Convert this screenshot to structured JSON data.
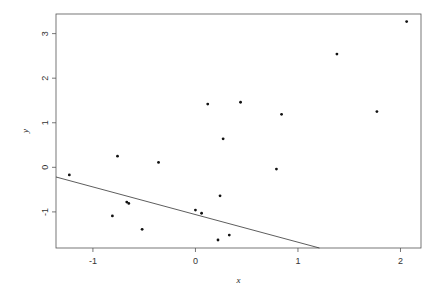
{
  "chart_data": {
    "type": "scatter",
    "title": "",
    "xlabel": "x",
    "ylabel": "y",
    "xlim": [
      -1.36,
      2.2
    ],
    "ylim": [
      -1.81,
      3.44
    ],
    "grid": false,
    "legend": "none",
    "x_ticks": [
      -1,
      0,
      1,
      2
    ],
    "x_tick_labels": [
      "-1",
      "0",
      "1",
      "2"
    ],
    "y_ticks": [
      -1,
      0,
      1,
      2,
      3
    ],
    "y_tick_labels": [
      "-1",
      "0",
      "1",
      "2",
      "3"
    ],
    "points": [
      {
        "x": -1.23,
        "y": -0.17
      },
      {
        "x": -0.76,
        "y": 0.25
      },
      {
        "x": -0.36,
        "y": 0.11
      },
      {
        "x": -0.67,
        "y": -0.78
      },
      {
        "x": -0.65,
        "y": -0.81
      },
      {
        "x": -0.81,
        "y": -1.09
      },
      {
        "x": -0.52,
        "y": -1.39
      },
      {
        "x": 0.0,
        "y": -0.96
      },
      {
        "x": 0.06,
        "y": -1.03
      },
      {
        "x": 0.22,
        "y": -1.63
      },
      {
        "x": 0.33,
        "y": -1.52
      },
      {
        "x": 0.24,
        "y": -0.64
      },
      {
        "x": 0.27,
        "y": 0.64
      },
      {
        "x": 0.12,
        "y": 1.42
      },
      {
        "x": 0.44,
        "y": 1.46
      },
      {
        "x": 0.79,
        "y": -0.04
      },
      {
        "x": 0.84,
        "y": 1.19
      },
      {
        "x": 1.38,
        "y": 2.54
      },
      {
        "x": 1.77,
        "y": 1.25
      },
      {
        "x": 2.06,
        "y": 3.27
      }
    ],
    "fitted_line": {
      "intercept": -1.06,
      "slope": -0.62
    },
    "colors": {
      "points": "#111111",
      "line": "#333333",
      "axes": "#555555"
    }
  }
}
